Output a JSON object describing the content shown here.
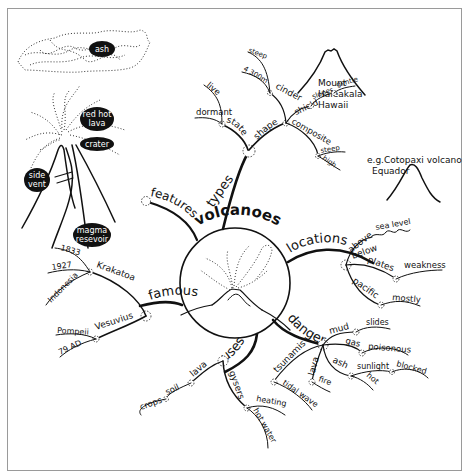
{
  "title": "volcanoes",
  "branches": {
    "features": "features",
    "types": "types",
    "locations": "locations",
    "dangers": "dangers",
    "uses": "uses",
    "famous": "famous"
  },
  "types": {
    "state": "state",
    "dormant": "dormant",
    "live": "live",
    "shape": "shape",
    "cinder": "cinder",
    "steep": "steep",
    "height": "4 300m",
    "shield": "shield",
    "slopes": "slopes",
    "gentle": "gentle",
    "composite": "composite",
    "comp_steep": "steep",
    "comp_high": "high"
  },
  "notes": {
    "haleakala": [
      "Mount",
      "Haleakala",
      "Hawaii"
    ],
    "cotopaxi": [
      "e.g.Cotopaxi volcano",
      "Equador"
    ]
  },
  "locations": {
    "above": "above",
    "sea_level": "sea level",
    "below": "below",
    "plates": "plates",
    "weakness": "weakness",
    "pacific": "pacific",
    "mostly": "mostly"
  },
  "dangers": {
    "mud": "mud",
    "slides": "slides",
    "gas": "gas",
    "poisonous": "poisonous",
    "ash": "ash",
    "sunlight": "sunlight",
    "blocked": "blocked",
    "hot": "hot",
    "lava": "lava",
    "fire": "fire",
    "tsunamis": "tsunamis",
    "tidal_wave": "tidal wave"
  },
  "uses": {
    "lava": "lava",
    "soil": "soil",
    "crops": "crops",
    "gysers": "gysers",
    "heating": "heating",
    "hot_water": "hot water"
  },
  "famous": {
    "krakatoa": "Krakatoa",
    "y1833": "1833",
    "y1927": "1927",
    "indonesia": "Indonesia",
    "vesuvius": "Vesuvius",
    "pompeii": "Pompeii",
    "ad79": "79 AD"
  },
  "features": {
    "ash": "ash",
    "red_hot_lava": [
      "red hot",
      "lava"
    ],
    "crater": "crater",
    "side_vent": [
      "side",
      "vent"
    ],
    "magma_reservoir": [
      "magma",
      "resevoir"
    ]
  }
}
